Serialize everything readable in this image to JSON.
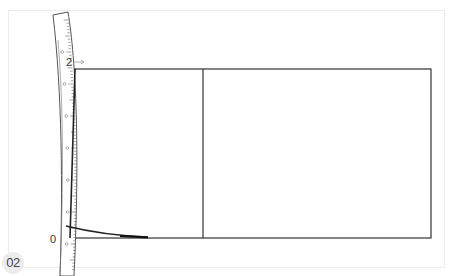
{
  "figure": {
    "step_badge": "02",
    "labels": {
      "top_mark": "2",
      "bottom_mark": "0"
    },
    "ruler": {
      "name": "flexible measuring tape",
      "tick_label_glyph": "см"
    },
    "colors": {
      "line": "#2a2a2a",
      "ruler_outline": "#555555",
      "arrow": "#888888",
      "frame": "#ececec",
      "badge_bg": "#ececec"
    }
  }
}
